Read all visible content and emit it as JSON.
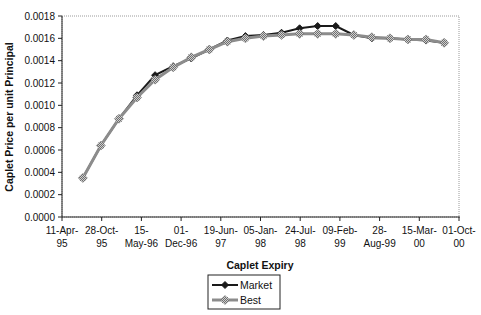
{
  "chart_data": {
    "type": "line",
    "title": "",
    "xlabel": "Caplet Expiry",
    "ylabel": "Caplet Price per unit Principal",
    "ylim": [
      0,
      0.0018
    ],
    "xlim": [
      "1995-04-11",
      "2000-10-01"
    ],
    "grid": false,
    "legend": "bottom-center",
    "y_ticks": [
      "0.0000",
      "0.0002",
      "0.0004",
      "0.0006",
      "0.0008",
      "0.0010",
      "0.0012",
      "0.0014",
      "0.0016",
      "0.0018"
    ],
    "x_ticks": [
      {
        "date": "1995-04-11",
        "line1": "11-Apr-",
        "line2": "95"
      },
      {
        "date": "1995-10-28",
        "line1": "28-Oct-",
        "line2": "95"
      },
      {
        "date": "1996-05-15",
        "line1": "15-",
        "line2": "May-96"
      },
      {
        "date": "1996-12-01",
        "line1": "01-",
        "line2": "Dec-96"
      },
      {
        "date": "1997-06-19",
        "line1": "19-Jun-",
        "line2": "97"
      },
      {
        "date": "1998-01-05",
        "line1": "05-Jan-",
        "line2": "98"
      },
      {
        "date": "1998-07-24",
        "line1": "24-Jul-",
        "line2": "98"
      },
      {
        "date": "1999-02-09",
        "line1": "09-Feb-",
        "line2": "99"
      },
      {
        "date": "1999-08-28",
        "line1": "28-",
        "line2": "Aug-99"
      },
      {
        "date": "2000-03-15",
        "line1": "15-Mar-",
        "line2": "00"
      },
      {
        "date": "2000-10-01",
        "line1": "01-Oct-",
        "line2": "00"
      }
    ],
    "x": [
      "1995-07-25",
      "1995-10-24",
      "1996-01-23",
      "1996-04-23",
      "1996-07-23",
      "1996-10-22",
      "1997-01-21",
      "1997-04-22",
      "1997-07-22",
      "1997-10-21",
      "1998-01-20",
      "1998-04-21",
      "1998-07-21",
      "1998-10-20",
      "1999-01-19",
      "1999-04-20",
      "1999-07-20",
      "1999-10-19",
      "2000-01-18",
      "2000-04-18",
      "2000-07-18"
    ],
    "series": [
      {
        "name": "Market",
        "color": "#1a1a1a",
        "marker": "diamond",
        "values": [
          0.00035,
          0.00064,
          0.00088,
          0.00109,
          0.00127,
          0.00135,
          0.00142,
          0.0015,
          0.00158,
          0.00162,
          0.00163,
          0.00165,
          0.00169,
          0.00171,
          0.00171,
          0.00163,
          0.0016,
          0.0016,
          0.00159,
          0.00158,
          0.00156
        ]
      },
      {
        "name": "Best",
        "color": "#8c8c8c",
        "marker": "hatched-square",
        "values": [
          0.00035,
          0.00064,
          0.00088,
          0.00107,
          0.00123,
          0.00134,
          0.00143,
          0.0015,
          0.00157,
          0.0016,
          0.00162,
          0.00163,
          0.00164,
          0.00164,
          0.00164,
          0.00163,
          0.00161,
          0.0016,
          0.00159,
          0.00159,
          0.00156
        ]
      }
    ]
  }
}
